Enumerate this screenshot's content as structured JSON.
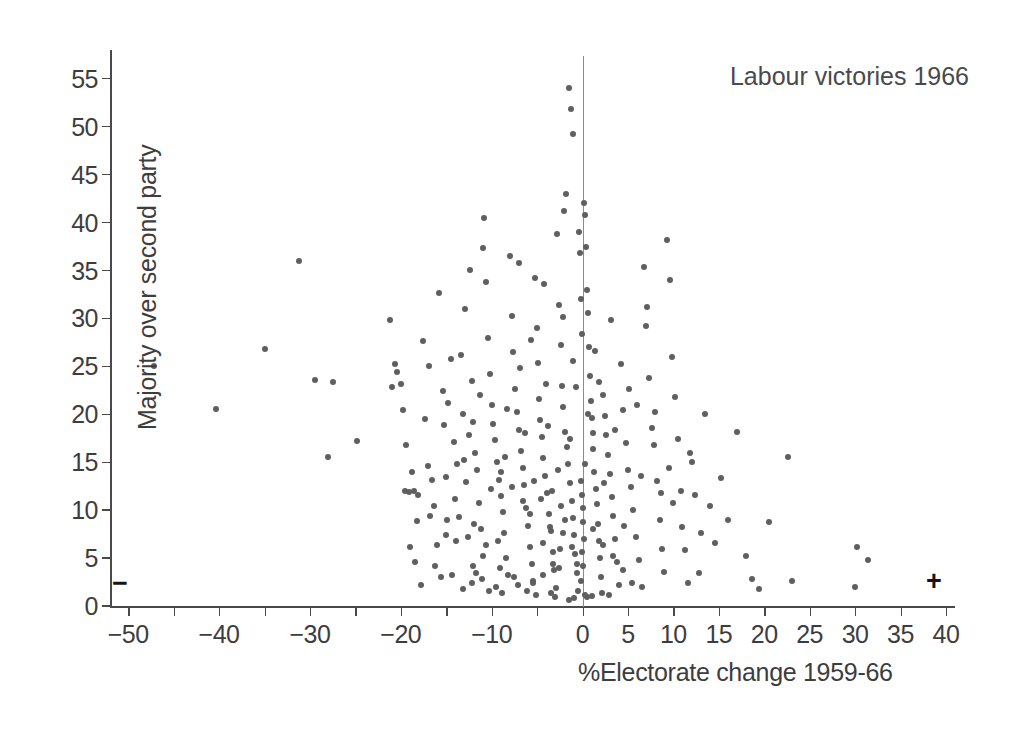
{
  "chart": {
    "title": "Labour victories 1966",
    "xlabel": "%Electorate change 1959-66",
    "ylabel": "Majority over second party",
    "minus_sign": "−",
    "plus_sign": "+"
  },
  "chart_data": {
    "type": "scatter",
    "title": "Labour victories 1966",
    "subtitle": "",
    "xlabel": "%Electorate change 1959-66",
    "ylabel": "Majority over second party",
    "xlim": [
      -52,
      41
    ],
    "ylim": [
      0,
      58
    ],
    "grid": false,
    "legend": null,
    "marker": {
      "shape": "circle",
      "color": "#5f5f5f",
      "size_px": 6
    },
    "annotations": [
      {
        "text": "−",
        "x": -50,
        "y": 2,
        "note": "minus sign at left of x axis"
      },
      {
        "text": "+",
        "x": 38.5,
        "y": 2,
        "note": "plus sign at right of x axis"
      },
      {
        "text": "Labour victories 1966",
        "x": 24,
        "y": 55,
        "note": "chart title, upper right"
      }
    ],
    "reference_lines": [
      {
        "axis": "vertical",
        "value": 0,
        "color": "#8b8b8b"
      }
    ],
    "xticks": [
      -50,
      -45,
      -40,
      -35,
      -30,
      -25,
      -20,
      -15,
      -10,
      -5,
      0,
      5,
      10,
      15,
      20,
      25,
      30,
      35,
      40
    ],
    "xticklabels": [
      "−50",
      "",
      "−40",
      "",
      "−30",
      "",
      "−20",
      "",
      "−10",
      "",
      "0",
      "5",
      "10",
      "15",
      "20",
      "25",
      "30",
      "35",
      "40"
    ],
    "yticks": [
      0,
      5,
      10,
      15,
      20,
      25,
      30,
      35,
      40,
      45,
      50,
      55
    ],
    "yticklabels": [
      "0",
      "5",
      "10",
      "15",
      "20",
      "25",
      "30",
      "35",
      "40",
      "45",
      "50",
      "55"
    ],
    "points": [
      [
        -47.2,
        25.0
      ],
      [
        -40.3,
        20.6
      ],
      [
        -35.0,
        26.8
      ],
      [
        -31.2,
        36.0
      ],
      [
        -29.4,
        23.6
      ],
      [
        -28.0,
        15.6
      ],
      [
        -27.5,
        23.4
      ],
      [
        -24.8,
        17.2
      ],
      [
        -21.2,
        29.8
      ],
      [
        -20.4,
        24.4
      ],
      [
        -20.0,
        23.2
      ],
      [
        -19.5,
        12.0
      ],
      [
        -19.1,
        11.9
      ],
      [
        -18.6,
        12.0
      ],
      [
        -18.1,
        11.6
      ],
      [
        -19.8,
        20.5
      ],
      [
        -19.4,
        16.8
      ],
      [
        -18.2,
        8.9
      ],
      [
        -17.6,
        27.6
      ],
      [
        -17.3,
        19.5
      ],
      [
        -17.0,
        14.6
      ],
      [
        -16.6,
        13.1
      ],
      [
        -16.3,
        10.4
      ],
      [
        -16.0,
        6.4
      ],
      [
        -15.8,
        32.7
      ],
      [
        -15.4,
        22.4
      ],
      [
        -15.2,
        18.9
      ],
      [
        -15.0,
        13.5
      ],
      [
        -14.8,
        21.2
      ],
      [
        -14.5,
        25.8
      ],
      [
        -14.2,
        17.1
      ],
      [
        -14.0,
        11.2
      ],
      [
        -13.6,
        9.3
      ],
      [
        -13.4,
        26.2
      ],
      [
        -13.1,
        20.0
      ],
      [
        -13.0,
        15.2
      ],
      [
        -12.8,
        12.9
      ],
      [
        -12.6,
        7.2
      ],
      [
        -12.4,
        35.1
      ],
      [
        -12.2,
        23.5
      ],
      [
        -12.0,
        19.2
      ],
      [
        -11.8,
        16.0
      ],
      [
        -11.6,
        14.2
      ],
      [
        -11.4,
        10.8
      ],
      [
        -11.2,
        8.0
      ],
      [
        -11.0,
        5.2
      ],
      [
        -10.8,
        40.5
      ],
      [
        -10.6,
        33.8
      ],
      [
        -10.4,
        28.0
      ],
      [
        -10.2,
        24.2
      ],
      [
        -10.0,
        21.0
      ],
      [
        -9.8,
        19.0
      ],
      [
        -9.6,
        17.3
      ],
      [
        -9.4,
        15.0
      ],
      [
        -9.2,
        13.2
      ],
      [
        -9.0,
        11.5
      ],
      [
        -8.8,
        9.8
      ],
      [
        -8.6,
        7.6
      ],
      [
        -8.4,
        5.0
      ],
      [
        -8.2,
        3.2
      ],
      [
        -8.0,
        36.5
      ],
      [
        -7.8,
        30.3
      ],
      [
        -7.6,
        26.5
      ],
      [
        -7.4,
        22.6
      ],
      [
        -7.2,
        20.2
      ],
      [
        -7.0,
        18.4
      ],
      [
        -6.8,
        16.2
      ],
      [
        -6.6,
        14.4
      ],
      [
        -6.4,
        12.6
      ],
      [
        -6.2,
        10.2
      ],
      [
        -6.0,
        8.4
      ],
      [
        -5.8,
        6.2
      ],
      [
        -5.6,
        4.4
      ],
      [
        -5.4,
        2.6
      ],
      [
        -5.2,
        34.2
      ],
      [
        -5.0,
        29.0
      ],
      [
        -4.9,
        25.4
      ],
      [
        -4.8,
        21.6
      ],
      [
        -4.7,
        19.4
      ],
      [
        -4.5,
        17.6
      ],
      [
        -4.3,
        15.4
      ],
      [
        -4.1,
        13.6
      ],
      [
        -3.9,
        11.8
      ],
      [
        -3.7,
        9.6
      ],
      [
        -3.5,
        7.8
      ],
      [
        -3.3,
        5.6
      ],
      [
        -3.1,
        3.8
      ],
      [
        -2.9,
        1.9
      ],
      [
        -2.8,
        38.8
      ],
      [
        -2.6,
        31.4
      ],
      [
        -2.4,
        27.2
      ],
      [
        -2.3,
        23.0
      ],
      [
        -2.1,
        20.8
      ],
      [
        -1.9,
        18.2
      ],
      [
        -1.7,
        16.6
      ],
      [
        -1.6,
        14.8
      ],
      [
        -1.4,
        12.8
      ],
      [
        -1.2,
        11.0
      ],
      [
        -1.1,
        9.2
      ],
      [
        -0.9,
        7.4
      ],
      [
        -0.8,
        5.4
      ],
      [
        -0.6,
        3.4
      ],
      [
        -0.5,
        1.6
      ],
      [
        -1.5,
        54.0
      ],
      [
        -1.3,
        51.8
      ],
      [
        -1.0,
        49.2
      ],
      [
        -1.8,
        43.0
      ],
      [
        -2.0,
        41.2
      ],
      [
        -0.4,
        39.0
      ],
      [
        -0.3,
        36.8
      ],
      [
        -0.2,
        32.0
      ],
      [
        -0.1,
        28.4
      ],
      [
        0.2,
        42.0
      ],
      [
        0.3,
        40.8
      ],
      [
        0.4,
        37.5
      ],
      [
        0.5,
        33.0
      ],
      [
        0.6,
        30.6
      ],
      [
        0.7,
        27.0
      ],
      [
        0.8,
        24.0
      ],
      [
        0.9,
        21.4
      ],
      [
        1.0,
        19.6
      ],
      [
        1.1,
        18.0
      ],
      [
        1.2,
        16.4
      ],
      [
        1.3,
        14.0
      ],
      [
        1.5,
        12.2
      ],
      [
        1.6,
        10.6
      ],
      [
        1.7,
        8.6
      ],
      [
        1.8,
        6.8
      ],
      [
        1.9,
        5.0
      ],
      [
        2.0,
        3.0
      ],
      [
        2.1,
        1.4
      ],
      [
        2.3,
        22.0
      ],
      [
        2.5,
        19.8
      ],
      [
        2.6,
        17.8
      ],
      [
        2.8,
        15.8
      ],
      [
        3.0,
        13.8
      ],
      [
        3.2,
        11.4
      ],
      [
        3.4,
        9.4
      ],
      [
        3.6,
        7.0
      ],
      [
        3.8,
        4.6
      ],
      [
        4.0,
        2.2
      ],
      [
        4.2,
        25.2
      ],
      [
        4.5,
        20.4
      ],
      [
        4.8,
        17.0
      ],
      [
        5.0,
        14.2
      ],
      [
        5.3,
        12.4
      ],
      [
        5.6,
        10.0
      ],
      [
        5.9,
        7.2
      ],
      [
        6.2,
        4.8
      ],
      [
        6.5,
        2.0
      ],
      [
        6.8,
        35.4
      ],
      [
        7.0,
        29.2
      ],
      [
        7.3,
        23.8
      ],
      [
        7.6,
        18.6
      ],
      [
        7.9,
        16.8
      ],
      [
        8.2,
        13.0
      ],
      [
        8.5,
        9.0
      ],
      [
        8.8,
        6.0
      ],
      [
        9.0,
        3.6
      ],
      [
        9.3,
        38.2
      ],
      [
        9.6,
        34.0
      ],
      [
        9.9,
        26.0
      ],
      [
        10.2,
        21.8
      ],
      [
        10.5,
        17.4
      ],
      [
        10.8,
        12.0
      ],
      [
        11.0,
        8.2
      ],
      [
        11.3,
        5.8
      ],
      [
        11.6,
        2.4
      ],
      [
        12.0,
        15.0
      ],
      [
        12.4,
        11.6
      ],
      [
        13.0,
        7.6
      ],
      [
        13.5,
        20.0
      ],
      [
        14.0,
        10.4
      ],
      [
        14.6,
        6.6
      ],
      [
        15.2,
        13.4
      ],
      [
        16.0,
        9.0
      ],
      [
        17.0,
        18.2
      ],
      [
        18.0,
        5.2
      ],
      [
        18.6,
        2.8
      ],
      [
        19.4,
        1.8
      ],
      [
        20.5,
        8.8
      ],
      [
        22.6,
        15.6
      ],
      [
        23.0,
        2.6
      ],
      [
        30.2,
        6.2
      ],
      [
        31.4,
        4.8
      ],
      [
        30.0,
        2.0
      ],
      [
        -12.9,
        31.0
      ],
      [
        -10.9,
        37.4
      ],
      [
        -6.9,
        24.8
      ],
      [
        -4.0,
        23.2
      ],
      [
        -2.7,
        14.2
      ],
      [
        -0.7,
        22.8
      ],
      [
        1.4,
        26.6
      ],
      [
        3.1,
        29.8
      ],
      [
        5.1,
        22.6
      ],
      [
        7.1,
        31.2
      ],
      [
        -16.9,
        25.0
      ],
      [
        -14.9,
        9.0
      ],
      [
        -13.9,
        6.8
      ],
      [
        -12.1,
        4.2
      ],
      [
        -11.1,
        2.8
      ],
      [
        -9.1,
        4.0
      ],
      [
        -7.1,
        2.2
      ],
      [
        -5.1,
        1.2
      ],
      [
        -3.0,
        0.9
      ],
      [
        -0.9,
        0.8
      ],
      [
        1.0,
        1.0
      ],
      [
        2.9,
        1.2
      ],
      [
        -8.9,
        1.4
      ],
      [
        -6.1,
        1.6
      ],
      [
        -17.8,
        2.2
      ],
      [
        -15.6,
        3.0
      ],
      [
        -13.2,
        1.8
      ],
      [
        -11.7,
        3.4
      ],
      [
        -10.3,
        1.6
      ],
      [
        -19.0,
        6.2
      ],
      [
        -18.4,
        4.6
      ],
      [
        -16.2,
        4.2
      ],
      [
        -14.4,
        3.2
      ],
      [
        -12.2,
        2.4
      ],
      [
        -9.5,
        2.0
      ],
      [
        -7.5,
        3.0
      ],
      [
        -5.5,
        2.4
      ],
      [
        -3.5,
        1.4
      ],
      [
        -1.5,
        0.6
      ],
      [
        0.5,
        0.9
      ],
      [
        -0.2,
        13.0
      ],
      [
        -0.1,
        11.6
      ],
      [
        0.1,
        10.2
      ],
      [
        0.0,
        8.8
      ],
      [
        0.15,
        7.0
      ],
      [
        -0.05,
        5.6
      ],
      [
        0.05,
        4.2
      ],
      [
        -0.15,
        2.6
      ],
      [
        0.25,
        1.2
      ],
      [
        -1.9,
        9.0
      ],
      [
        -2.2,
        7.6
      ],
      [
        -2.5,
        6.0
      ],
      [
        -3.2,
        4.4
      ],
      [
        -4.4,
        3.2
      ],
      [
        -5.8,
        9.6
      ],
      [
        -6.5,
        11.0
      ],
      [
        -7.8,
        12.4
      ],
      [
        -9.0,
        14.0
      ],
      [
        -10.6,
        6.4
      ],
      [
        -11.9,
        8.6
      ],
      [
        -13.8,
        14.8
      ],
      [
        -15.0,
        7.4
      ],
      [
        -16.8,
        9.4
      ],
      [
        -18.8,
        14.0
      ],
      [
        -4.6,
        11.2
      ],
      [
        -3.6,
        8.2
      ],
      [
        -2.4,
        10.4
      ],
      [
        -1.2,
        6.2
      ],
      [
        -0.6,
        4.4
      ],
      [
        1.2,
        8.0
      ],
      [
        2.2,
        6.4
      ],
      [
        3.4,
        5.2
      ],
      [
        4.4,
        3.8
      ],
      [
        5.4,
        2.4
      ],
      [
        -8.3,
        20.6
      ],
      [
        -7.0,
        35.8
      ],
      [
        -5.7,
        27.8
      ],
      [
        -4.2,
        33.6
      ],
      [
        -3.8,
        18.8
      ],
      [
        -2.2,
        30.2
      ],
      [
        -1.0,
        25.6
      ],
      [
        0.6,
        20.0
      ],
      [
        1.8,
        23.4
      ],
      [
        3.6,
        18.4
      ],
      [
        6.0,
        21.0
      ],
      [
        8.0,
        20.2
      ],
      [
        9.5,
        14.4
      ],
      [
        11.8,
        16.0
      ],
      [
        10.0,
        10.8
      ],
      [
        -12.5,
        17.8
      ],
      [
        -11.3,
        22.0
      ],
      [
        -10.1,
        12.2
      ],
      [
        -9.3,
        6.8
      ],
      [
        -8.5,
        15.6
      ],
      [
        -6.3,
        18.0
      ],
      [
        -5.3,
        13.0
      ],
      [
        -4.4,
        6.6
      ],
      [
        -3.4,
        12.0
      ],
      [
        -2.6,
        4.0
      ],
      [
        -1.4,
        17.4
      ],
      [
        0.3,
        14.8
      ],
      [
        2.4,
        12.8
      ],
      [
        4.6,
        8.4
      ],
      [
        6.4,
        13.6
      ],
      [
        8.6,
        11.8
      ],
      [
        12.8,
        3.4
      ],
      [
        -20.6,
        25.2
      ],
      [
        -21.0,
        22.8
      ]
    ]
  }
}
